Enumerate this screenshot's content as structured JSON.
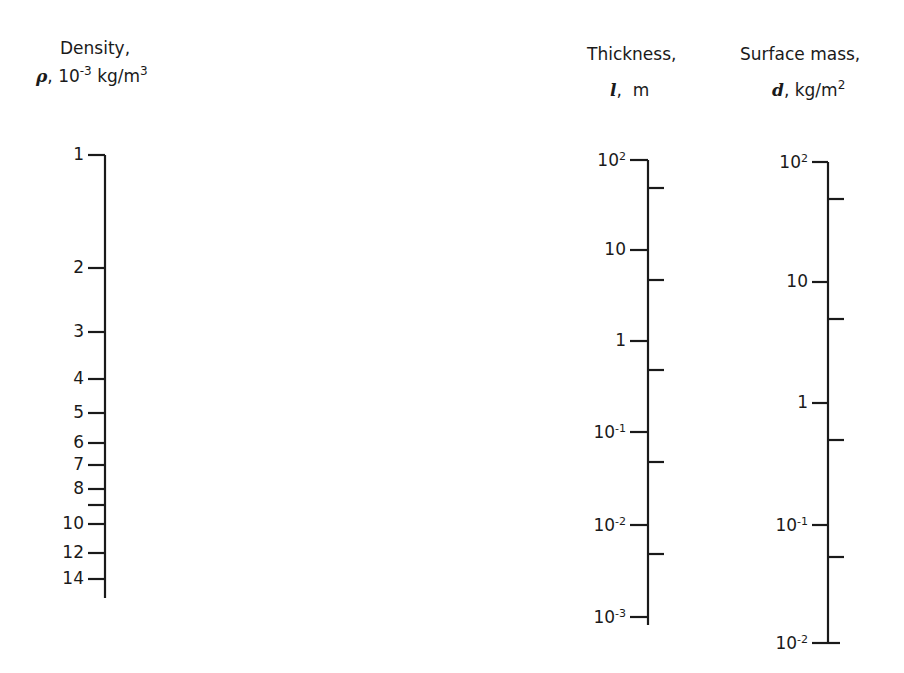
{
  "density_axis": {
    "title": "Density,",
    "symbol": "ρ",
    "unit_prefix": "10",
    "unit_prefix_exp": "-3",
    "unit": "kg/m",
    "unit_exp": "3"
  },
  "thickness_axis": {
    "title": "Thickness,",
    "symbol": "l",
    "unit": "m"
  },
  "surface_mass_axis": {
    "title": "Surface mass,",
    "symbol": "d",
    "unit": "kg/m",
    "unit_exp": "2"
  },
  "chart_data": {
    "type": "nomogram",
    "axes": [
      {
        "name": "Density",
        "symbol": "ρ",
        "unit": "10^-3 kg/m^3",
        "scale": "log",
        "ticks": [
          1,
          2,
          3,
          4,
          5,
          6,
          7,
          8,
          9,
          10,
          12,
          14
        ],
        "tick_labels": [
          "1",
          "2",
          "3",
          "4",
          "5",
          "6",
          "7",
          "8",
          "",
          "10",
          "12",
          "14"
        ],
        "range": [
          1,
          14
        ]
      },
      {
        "name": "Thickness",
        "symbol": "l",
        "unit": "m",
        "scale": "log",
        "major_ticks": [
          100,
          10,
          1,
          0.1,
          0.01,
          0.001
        ],
        "tick_labels": [
          "10^2",
          "10",
          "1",
          "10^-1",
          "10^-2",
          "10^-3"
        ],
        "minor_ticks": [
          50,
          5,
          0.5,
          0.05,
          0.005
        ],
        "range": [
          0.001,
          100
        ]
      },
      {
        "name": "Surface mass",
        "symbol": "d",
        "unit": "kg/m^2",
        "scale": "log",
        "major_ticks": [
          100,
          10,
          1,
          0.1,
          0.01
        ],
        "tick_labels": [
          "10^2",
          "10",
          "1",
          "10^-1",
          "10^-2"
        ],
        "minor_ticks": [
          50,
          5,
          0.5,
          0.05
        ],
        "range": [
          0.01,
          100
        ]
      }
    ]
  },
  "density_ticks": [
    {
      "label": "1",
      "y": 155
    },
    {
      "label": "2",
      "y": 268
    },
    {
      "label": "3",
      "y": 332
    },
    {
      "label": "4",
      "y": 379
    },
    {
      "label": "5",
      "y": 413
    },
    {
      "label": "6",
      "y": 443
    },
    {
      "label": "7",
      "y": 465
    },
    {
      "label": "8",
      "y": 489
    },
    {
      "label": "",
      "y": 505
    },
    {
      "label": "10",
      "y": 524
    },
    {
      "label": "12",
      "y": 553
    },
    {
      "label": "14",
      "y": 579
    }
  ],
  "thickness_ticks": [
    {
      "base": "10",
      "exp": "2",
      "y": 160
    },
    {
      "base": "10",
      "exp": "",
      "y": 250
    },
    {
      "base": "1",
      "exp": "",
      "y": 341
    },
    {
      "base": "10",
      "exp": "-1",
      "y": 432
    },
    {
      "base": "10",
      "exp": "-2",
      "y": 525
    },
    {
      "base": "10",
      "exp": "-3",
      "y": 617
    }
  ],
  "surface_ticks": [
    {
      "base": "10",
      "exp": "2",
      "y": 162
    },
    {
      "base": "10",
      "exp": "",
      "y": 282
    },
    {
      "base": "1",
      "exp": "",
      "y": 403
    },
    {
      "base": "10",
      "exp": "-1",
      "y": 525
    },
    {
      "base": "10",
      "exp": "-2",
      "y": 643
    }
  ]
}
